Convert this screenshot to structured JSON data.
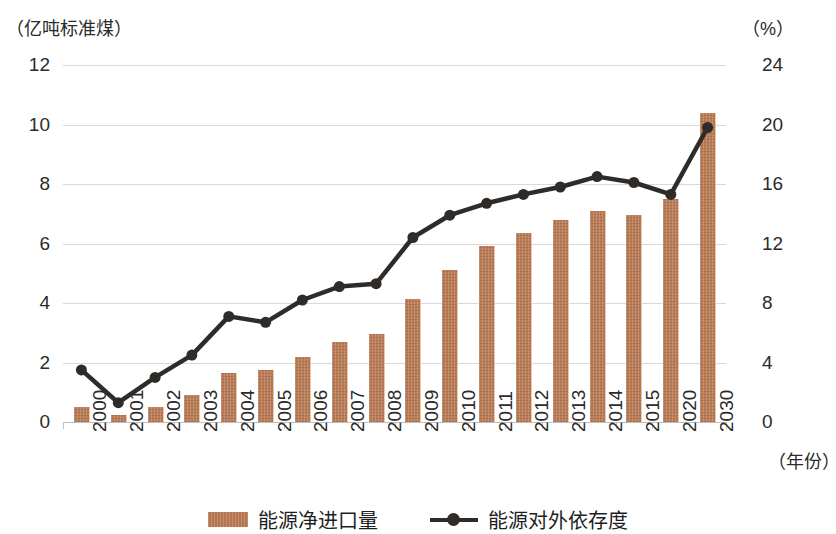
{
  "axes": {
    "left_unit": "（亿吨标准煤）",
    "right_unit": "（%）",
    "x_unit": "（年份）",
    "left_ticks": [
      "12",
      "10",
      "8",
      "6",
      "4",
      "2",
      "0"
    ],
    "right_ticks": [
      "24",
      "20",
      "16",
      "12",
      "8",
      "4",
      "0"
    ]
  },
  "legend": {
    "bar_label": "能源净进口量",
    "line_label": "能源对外依存度"
  },
  "colors": {
    "bar": "#b5764f",
    "line": "#2e2b28",
    "grid": "#d9d9d9"
  },
  "chart_data": {
    "type": "bar",
    "title": "",
    "xlabel": "（年份）",
    "ylabel": "（亿吨标准煤）",
    "y2label": "（%）",
    "ylim": [
      0,
      12
    ],
    "y2lim": [
      0,
      24
    ],
    "grid": true,
    "legend_position": "bottom-center",
    "categories": [
      "2000",
      "2001",
      "2002",
      "2003",
      "2004",
      "2005",
      "2006",
      "2007",
      "2008",
      "2009",
      "2010",
      "2011",
      "2012",
      "2013",
      "2014",
      "2015",
      "2020",
      "2030"
    ],
    "series": [
      {
        "name": "能源净进口量",
        "type": "bar",
        "axis": "left",
        "unit": "亿吨标准煤",
        "values": [
          0.5,
          0.25,
          0.5,
          0.9,
          1.65,
          1.75,
          2.2,
          2.7,
          2.95,
          4.15,
          5.1,
          5.9,
          6.35,
          6.8,
          7.1,
          6.95,
          7.5,
          10.4
        ]
      },
      {
        "name": "能源对外依存度",
        "type": "line",
        "axis": "right",
        "unit": "%",
        "values": [
          3.5,
          1.3,
          3.0,
          4.5,
          7.1,
          6.7,
          8.2,
          9.1,
          9.3,
          12.4,
          13.9,
          14.7,
          15.3,
          15.8,
          16.5,
          16.1,
          15.3,
          19.8
        ]
      }
    ]
  }
}
